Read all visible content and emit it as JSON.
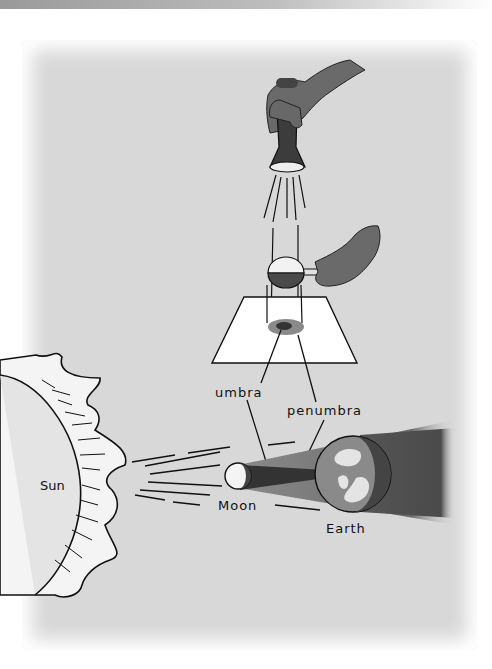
{
  "figure": {
    "labels": {
      "umbra": "umbra",
      "penumbra": "penumbra",
      "sun": "Sun",
      "moon": "Moon",
      "earth": "Earth"
    },
    "elements": {
      "top": "flashlight held by hand shining down",
      "middle": "ball on stick held by hand casting shadow on white card",
      "bottom": "Sun rays, Moon, Earth with umbra and penumbra cones"
    },
    "colors": {
      "background": "#d8d8d8",
      "umbra": "#3a3a3a",
      "penumbra": "#7a7a7a",
      "card": "#ffffff",
      "line": "#111111"
    }
  }
}
